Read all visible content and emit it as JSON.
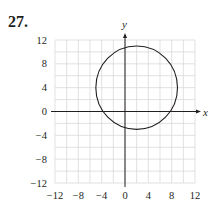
{
  "problem": {
    "number": "27."
  },
  "chart_data": {
    "type": "line",
    "title": "",
    "xlabel": "x",
    "ylabel": "y",
    "xlim": [
      -12,
      12
    ],
    "ylim": [
      -12,
      12
    ],
    "grid": true,
    "grid_step": 2,
    "x_ticks": [
      -12,
      -8,
      -4,
      0,
      4,
      8,
      12
    ],
    "y_ticks": [
      12,
      8,
      4,
      0,
      -4,
      -8,
      -12
    ],
    "x_tick_labels": [
      "−12",
      "−8",
      "−4",
      "0",
      "4",
      "8",
      "12"
    ],
    "y_tick_labels": [
      "12",
      "8",
      "4",
      "0",
      "−4",
      "−8",
      "−12"
    ],
    "series": [
      {
        "name": "circle",
        "shape": "circle",
        "center": [
          2,
          4
        ],
        "radius": 7,
        "color": "#231f20"
      }
    ]
  },
  "colors": {
    "ink": "#231f20",
    "grid": "#d9d9d9"
  }
}
